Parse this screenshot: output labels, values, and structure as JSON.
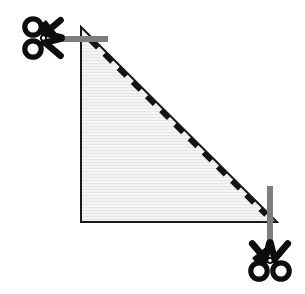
{
  "figure": {
    "name": "triangle-cut-line-diagram",
    "canvas": {
      "width": 305,
      "height": 294,
      "background": "#ffffff"
    },
    "shape": {
      "type": "right-triangle",
      "label": "shaded right triangle",
      "vertices": [
        {
          "name": "apex-top-left",
          "x": 81,
          "y": 27
        },
        {
          "name": "corner-bottom-left",
          "x": 81,
          "y": 222
        },
        {
          "name": "corner-bottom-right",
          "x": 277,
          "y": 222
        }
      ],
      "fill_color": "#f1f1f1",
      "stroke_color": "#1a1a1a",
      "stroke_width": 2,
      "texture": "faint-horizontal-stripes",
      "texture_color": "#e4e4e4"
    },
    "cut_line": {
      "name": "dashed-cut-line",
      "type": "dashed",
      "from": {
        "x": 90,
        "y": 40
      },
      "to": {
        "x": 266,
        "y": 215
      },
      "color": "#131313",
      "stroke_width": 5,
      "dash_pattern": "11 9"
    },
    "markers": [
      {
        "name": "guide-bar-horizontal",
        "orientation": "horizontal",
        "x": 55,
        "y": 36,
        "length": 53,
        "thickness": 6,
        "color": "#7d7d7d"
      },
      {
        "name": "guide-bar-vertical",
        "orientation": "vertical",
        "x": 267,
        "y": 186,
        "length": 58,
        "thickness": 6,
        "color": "#7d7d7d"
      }
    ],
    "scissors": [
      {
        "name": "scissors-top-left",
        "label": "scissors pointing right",
        "pivot": {
          "x": 43,
          "y": 38
        },
        "rotation_deg": 0,
        "scale": 1.0,
        "color": "#0d0d0d"
      },
      {
        "name": "scissors-bottom-right",
        "label": "scissors pointing up",
        "pivot": {
          "x": 268,
          "y": 255
        },
        "rotation_deg": -90,
        "scale": 1.0,
        "color": "#0d0d0d"
      }
    ]
  }
}
